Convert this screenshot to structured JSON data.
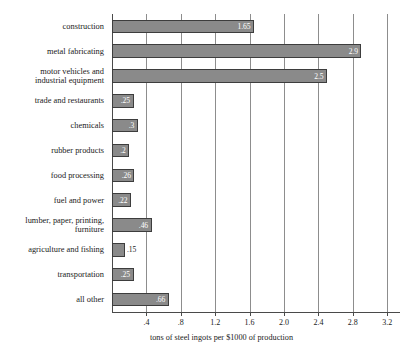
{
  "chart_data": {
    "type": "bar",
    "orientation": "horizontal",
    "title": "",
    "subtitle": "",
    "xlabel": "tons of steel ingots per $1000 of production",
    "ylabel": "",
    "xlim": [
      0,
      3.36
    ],
    "grid": true,
    "legend": null,
    "xticks": [
      ".4",
      ".8",
      "1.2",
      "1.6",
      "2.0",
      "2.4",
      "2.8",
      "3.2"
    ],
    "xtick_values": [
      0.4,
      0.8,
      1.2,
      1.6,
      2.0,
      2.4,
      2.8,
      3.2
    ],
    "categories": [
      "construction",
      "metal fabricating",
      "motor vehicles and\nindustrial equipment",
      "trade and restaurants",
      "chemicals",
      "rubber products",
      "food processing",
      "fuel and power",
      "lumber, paper, printing,\nfurniture",
      "agriculture and fishing",
      "transportation",
      "all other"
    ],
    "values": [
      1.65,
      2.9,
      2.5,
      0.25,
      0.3,
      0.2,
      0.26,
      0.22,
      0.46,
      0.15,
      0.25,
      0.66
    ],
    "value_labels": [
      "1.65",
      "2.9",
      "2.5",
      ".25",
      ".3",
      ".2",
      ".26",
      ".22",
      ".46",
      ".15",
      ".25",
      ".66"
    ],
    "label_placement": [
      "inside",
      "inside",
      "inside",
      "inside",
      "inside",
      "inside",
      "inside",
      "inside",
      "inside",
      "outside",
      "inside",
      "inside"
    ],
    "bar_color": "#8a8a8a",
    "bar_edge_color": "#3d3d3d",
    "gridline_color": "#8d8d8d",
    "axis_color": "#4a4a4a",
    "background_color": "#ffffff"
  }
}
